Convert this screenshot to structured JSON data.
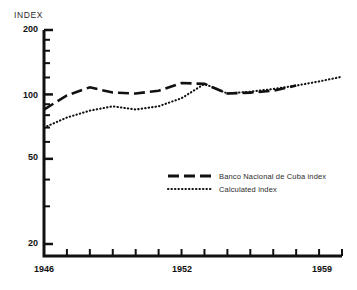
{
  "chart_data": {
    "type": "line",
    "title": "",
    "ylabel": "INDEX",
    "xlabel": "",
    "yscale": "log",
    "ylim": [
      20,
      200
    ],
    "ytick_labels": [
      "200",
      "100",
      "50",
      "20"
    ],
    "ytick_values": [
      200,
      100,
      50,
      20
    ],
    "xlim": [
      1946,
      1959
    ],
    "xtick_labels": [
      "1946",
      "1952",
      "1959"
    ],
    "xtick_values": [
      1946,
      1952,
      1959
    ],
    "x_minor_ticks": [
      1946,
      1947,
      1948,
      1949,
      1950,
      1951,
      1952,
      1953,
      1954,
      1955,
      1956,
      1957,
      1958,
      1959
    ],
    "grid": false,
    "legend_position": "center-right",
    "series": [
      {
        "name": "Banco Nacional de Cuba index",
        "style": "dashed",
        "x": [
          1946,
          1947,
          1948,
          1949,
          1950,
          1951,
          1952,
          1953,
          1954,
          1955,
          1956,
          1957
        ],
        "values": [
          85,
          99,
          108,
          102,
          101,
          104,
          113,
          112,
          101,
          102,
          104,
          110
        ]
      },
      {
        "name": "Calculated index",
        "style": "dotted",
        "x": [
          1946,
          1947,
          1948,
          1949,
          1950,
          1951,
          1952,
          1953,
          1954,
          1955,
          1956,
          1957,
          1958,
          1959
        ],
        "values": [
          70,
          78,
          84,
          88,
          85,
          88,
          96,
          112,
          101,
          103,
          106,
          110,
          115,
          121
        ]
      }
    ]
  },
  "axis": {
    "index_label": "INDEX",
    "y_200": "200",
    "y_100": "100",
    "y_50": "50",
    "y_20": "20",
    "x_1946": "1946",
    "x_1952": "1952",
    "x_1959": "1959"
  },
  "legend": {
    "banco_label": "Banco Nacional de Cuba index",
    "calculated_label": "Calculated index"
  },
  "colors": {
    "line": "#111111",
    "axis": "#111111",
    "background": "#ffffff"
  }
}
